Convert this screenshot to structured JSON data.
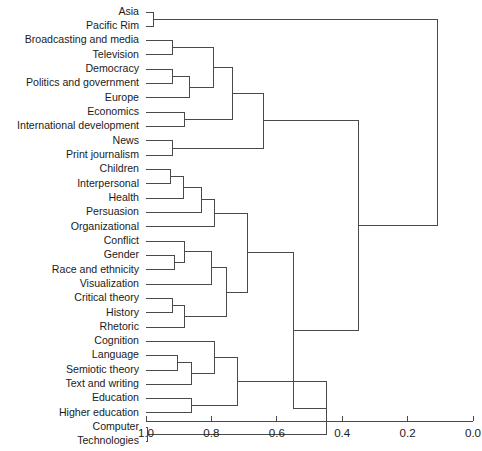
{
  "figure": {
    "title": "",
    "background": "#ffffff",
    "line_color": "#4a4a4a",
    "text_color": "#1b1b1b"
  },
  "chart_data": {
    "type": "dendrogram",
    "title": "",
    "xlabel": "",
    "ylabel": "",
    "orientation": "horizontal",
    "axis_position": "bottom",
    "grid": false,
    "legend": false,
    "xlim": [
      1.0,
      0.0
    ],
    "x_ticks": [
      {
        "value": 1.0,
        "label": "1.0"
      },
      {
        "value": 0.8,
        "label": "0.8"
      },
      {
        "value": 0.6,
        "label": "0.6"
      },
      {
        "value": 0.4,
        "label": "0.4"
      },
      {
        "value": 0.2,
        "label": "0.2"
      },
      {
        "value": 0.0,
        "label": "0.0"
      }
    ],
    "leaves": [
      {
        "index": 0,
        "label": "Asia"
      },
      {
        "index": 1,
        "label": "Pacific Rim"
      },
      {
        "index": 2,
        "label": "Broadcasting and media"
      },
      {
        "index": 3,
        "label": "Television"
      },
      {
        "index": 4,
        "label": "Democracy"
      },
      {
        "index": 5,
        "label": "Politics and government"
      },
      {
        "index": 6,
        "label": "Europe"
      },
      {
        "index": 7,
        "label": "Economics"
      },
      {
        "index": 8,
        "label": "International development"
      },
      {
        "index": 9,
        "label": "News"
      },
      {
        "index": 10,
        "label": "Print journalism"
      },
      {
        "index": 11,
        "label": "Children"
      },
      {
        "index": 12,
        "label": "Interpersonal"
      },
      {
        "index": 13,
        "label": "Health"
      },
      {
        "index": 14,
        "label": "Persuasion"
      },
      {
        "index": 15,
        "label": "Organizational"
      },
      {
        "index": 16,
        "label": "Conflict"
      },
      {
        "index": 17,
        "label": "Gender"
      },
      {
        "index": 18,
        "label": "Race and ethnicity"
      },
      {
        "index": 19,
        "label": "Visualization"
      },
      {
        "index": 20,
        "label": "Critical theory"
      },
      {
        "index": 21,
        "label": "History"
      },
      {
        "index": 22,
        "label": "Rhetoric"
      },
      {
        "index": 23,
        "label": "Cognition"
      },
      {
        "index": 24,
        "label": "Language"
      },
      {
        "index": 25,
        "label": "Semiotic theory"
      },
      {
        "index": 26,
        "label": "Text and writing"
      },
      {
        "index": 27,
        "label": "Education"
      },
      {
        "index": 28,
        "label": "Higher education"
      },
      {
        "index": 29,
        "label": "Computer"
      },
      {
        "index": 30,
        "label": "Technologies"
      }
    ],
    "merges": [
      {
        "id": "m1",
        "left": {
          "leaf": 0
        },
        "right": {
          "leaf": 1
        },
        "height": 0.978
      },
      {
        "id": "m2",
        "left": {
          "leaf": 2
        },
        "right": {
          "leaf": 3
        },
        "height": 0.92
      },
      {
        "id": "m3",
        "left": {
          "leaf": 4
        },
        "right": {
          "leaf": 5
        },
        "height": 0.92
      },
      {
        "id": "m4",
        "left": {
          "node": "m3"
        },
        "right": {
          "leaf": 6
        },
        "height": 0.868
      },
      {
        "id": "m5",
        "left": {
          "leaf": 7
        },
        "right": {
          "leaf": 8
        },
        "height": 0.882
      },
      {
        "id": "m6",
        "left": {
          "node": "m2"
        },
        "right": {
          "node": "m4"
        },
        "height": 0.795
      },
      {
        "id": "m7",
        "left": {
          "leaf": 9
        },
        "right": {
          "leaf": 10
        },
        "height": 0.92
      },
      {
        "id": "m8",
        "left": {
          "node": "m6"
        },
        "right": {
          "node": "m5"
        },
        "height": 0.735
      },
      {
        "id": "m9",
        "left": {
          "node": "m8"
        },
        "right": {
          "node": "m7"
        },
        "height": 0.64
      },
      {
        "id": "m10",
        "left": {
          "leaf": 11
        },
        "right": {
          "leaf": 12
        },
        "height": 0.925
      },
      {
        "id": "m11",
        "left": {
          "node": "m10"
        },
        "right": {
          "leaf": 13
        },
        "height": 0.885
      },
      {
        "id": "m12",
        "left": {
          "node": "m11"
        },
        "right": {
          "leaf": 14
        },
        "height": 0.83
      },
      {
        "id": "m13",
        "left": {
          "node": "m12"
        },
        "right": {
          "leaf": 15
        },
        "height": 0.79
      },
      {
        "id": "m14",
        "left": {
          "leaf": 17
        },
        "right": {
          "leaf": 18
        },
        "height": 0.912
      },
      {
        "id": "m15",
        "left": {
          "leaf": 16
        },
        "right": {
          "node": "m14"
        },
        "height": 0.882
      },
      {
        "id": "m16",
        "left": {
          "leaf": 20
        },
        "right": {
          "leaf": 21
        },
        "height": 0.92
      },
      {
        "id": "m17",
        "left": {
          "node": "m16"
        },
        "right": {
          "leaf": 22
        },
        "height": 0.882
      },
      {
        "id": "m18",
        "left": {
          "node": "m15"
        },
        "right": {
          "leaf": 19
        },
        "height": 0.8
      },
      {
        "id": "m19",
        "left": {
          "node": "m18"
        },
        "right": {
          "node": "m17"
        },
        "height": 0.755
      },
      {
        "id": "m20",
        "left": {
          "node": "m13"
        },
        "right": {
          "node": "m19"
        },
        "height": 0.69
      },
      {
        "id": "m21",
        "left": {
          "leaf": 24
        },
        "right": {
          "leaf": 25
        },
        "height": 0.905
      },
      {
        "id": "m22",
        "left": {
          "node": "m21"
        },
        "right": {
          "leaf": 26
        },
        "height": 0.862
      },
      {
        "id": "m23",
        "left": {
          "leaf": 23
        },
        "right": {
          "node": "m22"
        },
        "height": 0.79
      },
      {
        "id": "m24",
        "left": {
          "leaf": 27
        },
        "right": {
          "leaf": 28
        },
        "height": 0.862
      },
      {
        "id": "m25",
        "left": {
          "node": "m23"
        },
        "right": {
          "node": "m24"
        },
        "height": 0.72
      },
      {
        "id": "m26",
        "left": {
          "leaf": 29
        },
        "right": {
          "leaf": 30
        },
        "height": 0.995
      },
      {
        "id": "m27",
        "left": {
          "node": "m25"
        },
        "right": {
          "node": "m26"
        },
        "height": 0.448
      },
      {
        "id": "m28",
        "left": {
          "node": "m20"
        },
        "right": {
          "node": "m27"
        },
        "height": 0.548
      },
      {
        "id": "m29",
        "left": {
          "node": "m9"
        },
        "right": {
          "node": "m28"
        },
        "height": 0.35
      },
      {
        "id": "m30",
        "left": {
          "node": "m1"
        },
        "right": {
          "node": "m29"
        },
        "height": 0.11
      }
    ]
  },
  "layout": {
    "plot_left": 146,
    "plot_right": 473,
    "first_leaf_y": 12,
    "row_step": 14.32,
    "label_right": 139,
    "axis_y": 421,
    "tick_len": 5,
    "tick_label_y": 428
  }
}
